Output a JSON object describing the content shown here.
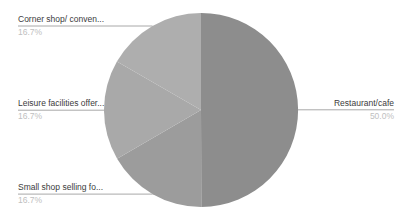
{
  "chart_data": {
    "type": "pie",
    "title": "",
    "labels_position": "outside",
    "legend": "none",
    "direction": "clockwise",
    "start_angle_deg": 0,
    "slices": [
      {
        "label": "Restaurant/cafe",
        "pct_label": "50.0%",
        "value": 50.0,
        "color": "#8d8d8d"
      },
      {
        "label": "Small shop selling fo...",
        "pct_label": "16.7%",
        "value": 16.7,
        "color": "#9c9c9c"
      },
      {
        "label": "Leisure facilities offer...",
        "pct_label": "16.7%",
        "value": 16.7,
        "color": "#a9a9a9"
      },
      {
        "label": "Corner shop/ conven...",
        "pct_label": "16.7%",
        "value": 16.7,
        "color": "#aeaeae"
      }
    ]
  },
  "colors": {
    "background": "#ffffff",
    "label_text": "#3b3b3b",
    "pct_text": "#c0c0c0",
    "leader_line": "#a8a8a8"
  }
}
